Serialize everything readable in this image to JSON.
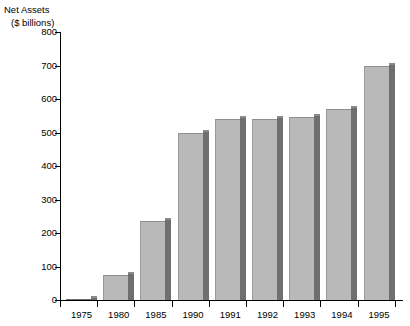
{
  "chart_data": {
    "type": "bar",
    "title": "Net Assets",
    "subtitle": "($ billions)",
    "xlabel": "",
    "ylabel": "Net Assets ($ billions)",
    "categories": [
      "1975",
      "1980",
      "1985",
      "1990",
      "1991",
      "1992",
      "1993",
      "1994",
      "1995"
    ],
    "values": [
      3,
      75,
      235,
      500,
      540,
      540,
      546,
      570,
      700
    ],
    "ylim": [
      0,
      800
    ],
    "yticks": [
      0,
      100,
      200,
      300,
      400,
      500,
      600,
      700,
      800
    ],
    "ytick_labels": [
      "0",
      "100",
      "200",
      "300",
      "400",
      "500",
      "600",
      "700",
      "800"
    ],
    "grid": false,
    "legend": false,
    "bar_color": "#b9b9b9",
    "bar_shadow_color": "#6f6f6f",
    "axis_color": "#000000",
    "background_color": "#ffffff"
  },
  "axis_titles": {
    "line1": "Net Assets",
    "line2": "($ billions)"
  }
}
